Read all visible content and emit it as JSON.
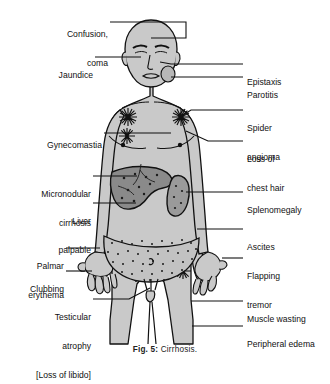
{
  "figure": {
    "caption_prefix": "Fig. 5:",
    "caption_text": "Cirrhosis."
  },
  "colors": {
    "skin": "#c9c9c9",
    "outline": "#111111",
    "liver": "#8a8a8a",
    "spleen": "#9a9a9a",
    "ascites_dots": "#1a1a1a",
    "text": "#111111"
  },
  "labels_left": [
    {
      "id": "confusion-coma",
      "line1": "Confusion,",
      "line2": "coma"
    },
    {
      "id": "jaundice",
      "line1": "Jaundice",
      "line2": ""
    },
    {
      "id": "gynecomastia",
      "line1": "Gynecomastia",
      "line2": ""
    },
    {
      "id": "micronodular-cirrhosis",
      "line1": "Micronodular",
      "line2": "cirrhosis"
    },
    {
      "id": "liver-palpable",
      "line1": "Liver",
      "line2": "palpable"
    },
    {
      "id": "palmar-erythema",
      "line1": "Palmar",
      "line2": "erythema"
    },
    {
      "id": "clubbing",
      "line1": "Clubbing",
      "line2": ""
    },
    {
      "id": "testicular-atrophy",
      "line1": "Testicular",
      "line2": "atrophy",
      "line3": "[Loss of libido]"
    }
  ],
  "labels_right": [
    {
      "id": "epistaxis",
      "line1": "Epistaxis",
      "line2": ""
    },
    {
      "id": "parotitis",
      "line1": "Parotitis",
      "line2": ""
    },
    {
      "id": "spider-angioma",
      "line1": "Spider",
      "line2": "angioma"
    },
    {
      "id": "loss-of-chest-hair",
      "line1": "Loss of",
      "line2": "chest hair"
    },
    {
      "id": "splenomegaly",
      "line1": "Splenomegaly",
      "line2": ""
    },
    {
      "id": "ascites",
      "line1": "Ascites",
      "line2": ""
    },
    {
      "id": "flapping-tremor",
      "line1": "Flapping",
      "line2": "tremor"
    },
    {
      "id": "muscle-wasting",
      "line1": "Muscle wasting",
      "line2": ""
    },
    {
      "id": "peripheral-edema",
      "line1": "Peripheral edema",
      "line2": ""
    }
  ]
}
